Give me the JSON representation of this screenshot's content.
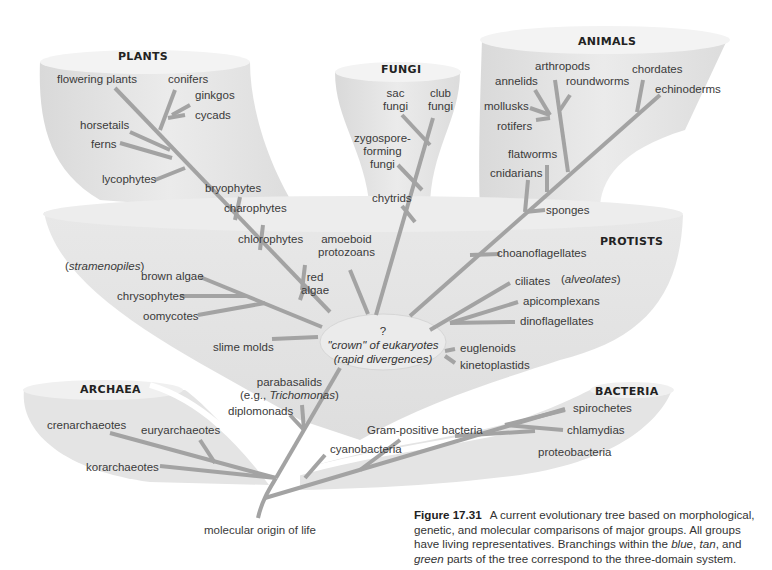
{
  "groups": {
    "plants": "PLANTS",
    "fungi": "FUNGI",
    "animals": "ANIMALS",
    "protists": "PROTISTS",
    "archaea": "ARCHAEA",
    "bacteria": "BACTERIA"
  },
  "plants": {
    "flowering_plants": "flowering plants",
    "conifers": "conifers",
    "ginkgos": "ginkgos",
    "cycads": "cycads",
    "horsetails": "horsetails",
    "ferns": "ferns",
    "lycophytes": "lycophytes",
    "bryophytes": "bryophytes",
    "charophytes": "charophytes",
    "chlorophytes": "chlorophytes"
  },
  "fungi": {
    "sac_fungi_1": "sac",
    "sac_fungi_2": "fungi",
    "club_fungi_1": "club",
    "club_fungi_2": "fungi",
    "zygo_1": "zygospore-",
    "zygo_2": "forming",
    "zygo_3": "fungi",
    "chytrids": "chytrids"
  },
  "animals": {
    "arthropods": "arthropods",
    "annelids": "annelids",
    "roundworms": "roundworms",
    "chordates": "chordates",
    "echinoderms": "echinoderms",
    "mollusks": "mollusks",
    "rotifers": "rotifers",
    "flatworms": "flatworms",
    "cnidarians": "cnidarians",
    "sponges": "sponges"
  },
  "protists": {
    "amoeboid_1": "amoeboid",
    "amoeboid_2": "protozoans",
    "choanoflagellates": "choanoflagellates",
    "stramenopiles": "stramenopiles",
    "brown_algae": "brown algae",
    "red_algae_1": "red",
    "red_algae_2": "algae",
    "chrysophytes": "chrysophytes",
    "oomycotes": "oomycotes",
    "slime_molds": "slime molds",
    "ciliates": "ciliates",
    "alveolates": "alveolates",
    "apicomplexans": "apicomplexans",
    "dinoflagellates": "dinoflagellates",
    "euglenoids": "euglenoids",
    "kinetoplastids": "kinetoplastids",
    "parabasalids": "parabasalids",
    "eg": "(e.g., ",
    "trichomonas": "Trichomonas",
    "diplomonads": "diplomonads"
  },
  "crown": {
    "question": "?",
    "line1": "\"crown\" of eukaryotes",
    "line2": "(rapid divergences)"
  },
  "archaea": {
    "crenarchaeotes": "crenarchaeotes",
    "euryarchaeotes": "euryarchaeotes",
    "korarchaeotes": "korarchaeotes"
  },
  "bacteria": {
    "spirochetes": "spirochetes",
    "chlamydias": "chlamydias",
    "gram_positive": "Gram-positive bacteria",
    "cyanobacteria": "cyanobacteria",
    "proteobacteria": "proteobacteria"
  },
  "root": "molecular origin of life",
  "caption": {
    "figure": "Figure 17.31",
    "text1": "A current evolutionary tree based on morphological, genetic, and molecular comparisons of major groups. All groups have living representatives. Branchings within the ",
    "blue": "blue",
    "comma": ", ",
    "tan": "tan",
    "and": ", and ",
    "green": "green",
    "text2": " parts of the tree correspond to the three-domain system."
  },
  "colors": {
    "background": "#ffffff",
    "tube_fill": "#e6e6e6",
    "tube_rim": "#f2f2f2",
    "branch": "#a3a3a3",
    "text": "#3a3a3a"
  }
}
